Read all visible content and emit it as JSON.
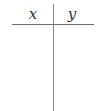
{
  "table": {
    "columns": [
      {
        "label": "x"
      },
      {
        "label": "y"
      }
    ],
    "rows": []
  },
  "colors": {
    "lines": "#8a8a8a",
    "text": "#333333",
    "background": "#ffffff"
  }
}
